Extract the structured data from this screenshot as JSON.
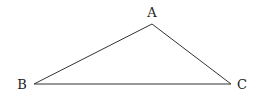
{
  "diagram": {
    "type": "triangle",
    "vertices": [
      {
        "label": "A",
        "x": 152,
        "y": 24,
        "label_x": 152,
        "label_y": 17
      },
      {
        "label": "B",
        "x": 34,
        "y": 84,
        "label_x": 22,
        "label_y": 89
      },
      {
        "label": "C",
        "x": 231,
        "y": 84,
        "label_x": 242,
        "label_y": 89
      }
    ],
    "edges": [
      [
        "A",
        "B"
      ],
      [
        "B",
        "C"
      ],
      [
        "C",
        "A"
      ]
    ],
    "colors": {
      "stroke": "#333333",
      "text": "#222222",
      "background": "#ffffff"
    }
  }
}
